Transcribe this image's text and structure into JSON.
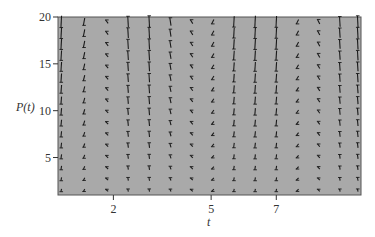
{
  "chart_data": {
    "type": "slope_field",
    "title": "",
    "xlabel": "t",
    "ylabel": "P(t)",
    "xticks": [
      2,
      5,
      7
    ],
    "yticks": [
      5,
      10,
      15,
      20
    ],
    "xlim": [
      0.3,
      9.6
    ],
    "ylim": [
      1,
      20
    ],
    "grid": false,
    "legend": null,
    "background_color": "#a9a9a9",
    "segment_color": "#1a1a1a",
    "columns_t": [
      0.4,
      1.1,
      1.8,
      2.45,
      3.1,
      3.75,
      4.4,
      5.05,
      5.7,
      6.35,
      7.0,
      7.65,
      8.3,
      8.95,
      9.5
    ],
    "rows_P": [
      1.5,
      2.7,
      3.9,
      5.1,
      6.3,
      7.5,
      8.7,
      9.9,
      11.1,
      12.3,
      13.5,
      14.7,
      15.9,
      17.1,
      18.3,
      19.5
    ],
    "column_slope_factor": [
      1.0,
      0.55,
      -0.15,
      -0.9,
      -1.0,
      -0.6,
      -0.2,
      0.25,
      0.9,
      1.0,
      0.95,
      0.25,
      -0.25,
      -0.85,
      -1.0
    ]
  },
  "axes": {
    "x_label": "t",
    "y_label": "P(t)",
    "x_tick_labels": [
      "2",
      "5",
      "7"
    ],
    "y_tick_labels": [
      "5",
      "10",
      "15",
      "20"
    ]
  }
}
